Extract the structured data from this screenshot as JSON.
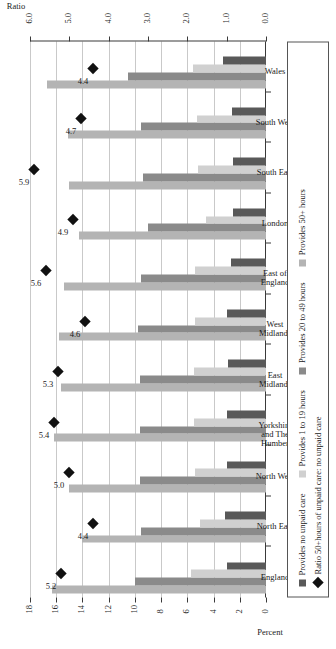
{
  "chart_data": {
    "type": "bar",
    "title": "",
    "xlabel": "",
    "ylabel_left": "Percent",
    "ylabel_right": "Ratio",
    "orientation": "horizontal-rotated",
    "grid": true,
    "legend_position": "bottom",
    "categories": [
      "England",
      "North East",
      "North West",
      "Yorkshire\nand The\nHumber",
      "East\nMidlands",
      "West\nMidlands",
      "East of\nEngland",
      "London",
      "South East",
      "South West",
      "Wales"
    ],
    "percent_axis": {
      "label": "Percent",
      "ticks": [
        0,
        2,
        4,
        6,
        8,
        10,
        12,
        14,
        16,
        18
      ],
      "tick_labels": [
        "0",
        "2",
        "4",
        "6",
        "8",
        "10",
        "12",
        "14",
        "16",
        "18"
      ],
      "lim": [
        0,
        18
      ]
    },
    "ratio_axis": {
      "label": "Ratio",
      "ticks": [
        0.0,
        1.0,
        2.0,
        3.0,
        4.0,
        5.0,
        6.0
      ],
      "tick_labels": [
        "0.0",
        "1.0",
        "2.0",
        "3.0",
        "4.0",
        "5.0",
        "6.0"
      ],
      "lim": [
        0,
        6
      ]
    },
    "series": [
      {
        "name": "Provides no unpaid care",
        "color": "#595959",
        "values": [
          3.0,
          3.1,
          3.0,
          3.0,
          2.9,
          3.0,
          2.7,
          2.5,
          2.5,
          2.6,
          3.3
        ]
      },
      {
        "name": "Provides 1 to 19 hours",
        "color": "#d0d0d0",
        "values": [
          5.7,
          5.0,
          5.4,
          5.5,
          5.5,
          5.4,
          5.4,
          4.6,
          5.2,
          5.3,
          5.6
        ]
      },
      {
        "name": "Provides 20 to 49 hours",
        "color": "#8a8a8a",
        "values": [
          10.0,
          9.5,
          9.6,
          9.6,
          9.6,
          9.8,
          9.5,
          9.0,
          9.4,
          9.5,
          10.5
        ]
      },
      {
        "name": "Provides 50+ hours",
        "color": "#b4b4b4",
        "values": [
          16.3,
          14.0,
          15.0,
          16.2,
          15.6,
          15.8,
          15.4,
          14.3,
          15.0,
          15.1,
          16.7
        ]
      }
    ],
    "ratio_series": {
      "name": "Ratio 50+hours of unpaid care: no unpaid care",
      "marker": "diamond",
      "color": "#111111",
      "values": [
        5.2,
        4.4,
        5.0,
        5.4,
        5.3,
        4.6,
        5.6,
        4.9,
        5.9,
        4.7,
        4.4
      ],
      "labels": [
        "5.2",
        "4.4",
        "5.0",
        "5.4",
        "5.3",
        "4.6",
        "5.6",
        "4.9",
        "5.9",
        "4.7",
        "4.4"
      ]
    }
  },
  "legend": {
    "items": [
      {
        "label": "Provides no unpaid care",
        "color": "#595959",
        "marker": "square"
      },
      {
        "label": "Provides 1 to 19 hours",
        "color": "#d0d0d0",
        "marker": "square"
      },
      {
        "label": "Provides 20 to 49 hours",
        "color": "#8a8a8a",
        "marker": "square"
      },
      {
        "label": "Provides 50+ hours",
        "color": "#b4b4b4",
        "marker": "square"
      },
      {
        "label": "Ratio 50+hours of unpaid care: no unpaid care",
        "color": "#111111",
        "marker": "diamond"
      }
    ]
  }
}
